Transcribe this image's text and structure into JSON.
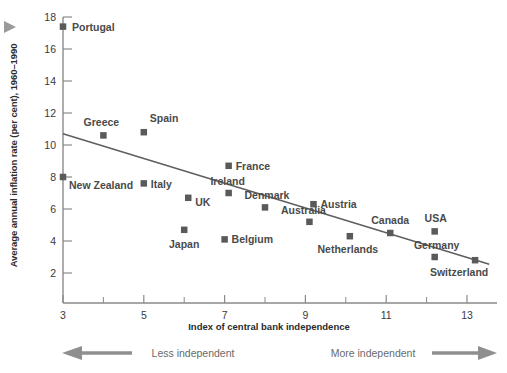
{
  "chart_data": {
    "type": "scatter",
    "title": "",
    "xlabel": "Index of central bank independence",
    "ylabel": "Average annual inflation rate (per cent), 1960–1990",
    "xlim": [
      2.5,
      13.6
    ],
    "ylim": [
      1.0,
      18.0
    ],
    "xticks": [
      3,
      5,
      7,
      9,
      11,
      13
    ],
    "xticklabels": [
      "3",
      "5",
      "7",
      "9",
      "11",
      "13"
    ],
    "xminorticks": [
      4,
      6,
      8,
      10,
      12
    ],
    "yticks": [
      2,
      4,
      6,
      8,
      10,
      12,
      14,
      16,
      18
    ],
    "yticklabels": [
      "2",
      "4",
      "6",
      "8",
      "10",
      "12",
      "14",
      "16",
      "18"
    ],
    "grid": false,
    "legend": "none",
    "marker": "square",
    "points": [
      {
        "label": "Portugal",
        "x": 3.0,
        "y": 17.4,
        "label_dx": 9,
        "label_dy": 4,
        "anchor": "start"
      },
      {
        "label": "Greece",
        "x": 4.0,
        "y": 10.6,
        "label_dx": -2,
        "label_dy": -9,
        "anchor": "middle"
      },
      {
        "label": "Spain",
        "x": 5.0,
        "y": 10.8,
        "label_dx": 6,
        "label_dy": -10,
        "anchor": "start"
      },
      {
        "label": "New Zealand",
        "x": 3.0,
        "y": 8.0,
        "label_dx": 6,
        "label_dy": 12,
        "anchor": "start"
      },
      {
        "label": "Italy",
        "x": 5.0,
        "y": 7.6,
        "label_dx": 7,
        "label_dy": 5,
        "anchor": "start"
      },
      {
        "label": "UK",
        "x": 6.1,
        "y": 6.7,
        "label_dx": 7,
        "label_dy": 8,
        "anchor": "start"
      },
      {
        "label": "Japan",
        "x": 6.0,
        "y": 4.7,
        "label_dx": 0,
        "label_dy": 18,
        "anchor": "middle"
      },
      {
        "label": "France",
        "x": 7.1,
        "y": 8.7,
        "label_dx": 7,
        "label_dy": 4,
        "anchor": "start"
      },
      {
        "label": "Ireland",
        "x": 7.1,
        "y": 7.0,
        "label_dx": -1,
        "label_dy": -8,
        "anchor": "middle"
      },
      {
        "label": "Belgium",
        "x": 7.0,
        "y": 4.1,
        "label_dx": 7,
        "label_dy": 4,
        "anchor": "start"
      },
      {
        "label": "Denmark",
        "x": 8.0,
        "y": 6.1,
        "label_dx": 2,
        "label_dy": -8,
        "anchor": "middle"
      },
      {
        "label": "Australia",
        "x": 9.1,
        "y": 5.2,
        "label_dx": -6,
        "label_dy": -8,
        "anchor": "middle"
      },
      {
        "label": "Austria",
        "x": 9.2,
        "y": 6.3,
        "label_dx": 7,
        "label_dy": 4,
        "anchor": "start"
      },
      {
        "label": "Netherlands",
        "x": 10.1,
        "y": 4.3,
        "label_dx": -2,
        "label_dy": 17,
        "anchor": "middle"
      },
      {
        "label": "Canada",
        "x": 11.1,
        "y": 4.5,
        "label_dx": 0,
        "label_dy": -9,
        "anchor": "middle"
      },
      {
        "label": "USA",
        "x": 12.2,
        "y": 4.6,
        "label_dx": 1,
        "label_dy": -9,
        "anchor": "middle"
      },
      {
        "label": "Germany",
        "x": 12.2,
        "y": 3.0,
        "label_dx": 2,
        "label_dy": -8,
        "anchor": "middle"
      },
      {
        "label": "Switzerland",
        "x": 13.2,
        "y": 2.8,
        "label_dx": -16,
        "label_dy": 16,
        "anchor": "middle"
      }
    ],
    "trendline": {
      "x0": 3.0,
      "y0": 10.7,
      "x1": 13.55,
      "y1": 2.55
    }
  },
  "annotations": {
    "left_arrow_caption": "Less independent",
    "right_arrow_caption": "More independent",
    "corner_marker": "play-triangle"
  },
  "colors": {
    "marker": "#5a5a5a",
    "line": "#5f5f5f",
    "axis": "#8a8a8a",
    "text": "#3a3a3a",
    "label_text": "#4a4a4a",
    "caption_text": "#6a6a6a",
    "arrow": "#8f8f8f",
    "background": "#ffffff"
  }
}
